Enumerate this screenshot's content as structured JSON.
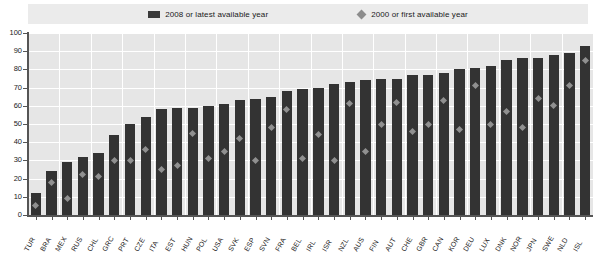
{
  "legend": {
    "position": "top-center",
    "items": [
      {
        "label": "2008 or latest available year",
        "marker": "bar-swatch",
        "color": "#333333"
      },
      {
        "label": "2000 or first available year",
        "marker": "diamond",
        "color": "#909090"
      }
    ]
  },
  "axes": {
    "y": {
      "ticks": [
        "0",
        "10",
        "20",
        "30",
        "40",
        "50",
        "60",
        "70",
        "80",
        "90",
        "100"
      ],
      "min": 0,
      "max": 100,
      "step": 10,
      "label": ""
    },
    "x": {
      "label": ""
    }
  },
  "chart_data": {
    "type": "bar",
    "title": "",
    "subtitle": "",
    "xlabel": "",
    "ylabel": "",
    "ylim": [
      0,
      100
    ],
    "grid": true,
    "categories": [
      "TUR",
      "BRA",
      "MEX",
      "RUS",
      "CHL",
      "GRC",
      "PRT",
      "CZE",
      "ITA",
      "EST",
      "HUN",
      "POL",
      "USA",
      "SVK",
      "ESP",
      "SVN",
      "FRA",
      "BEL",
      "IRL",
      "ISR",
      "NZL",
      "AUS",
      "FIN",
      "AUT",
      "CHE",
      "GBR",
      "CAN",
      "KOR",
      "DEU",
      "LUX",
      "DNK",
      "NOR",
      "JPN",
      "SWE",
      "NLD",
      "ISL"
    ],
    "series": [
      {
        "name": "2008 or latest available year",
        "type": "bar",
        "color": "#333333",
        "values": [
          12,
          24,
          29,
          32,
          34,
          44,
          50,
          54,
          58,
          59,
          59,
          60,
          61,
          63,
          64,
          65,
          68,
          69,
          70,
          72,
          73,
          74,
          75,
          75,
          77,
          77,
          78,
          80,
          81,
          82,
          85,
          86,
          86,
          88,
          89,
          93
        ]
      },
      {
        "name": "2000 or first available year",
        "type": "scatter-diamond",
        "color": "#909090",
        "values": [
          5,
          18,
          9,
          22,
          21,
          30,
          30,
          36,
          25,
          27,
          45,
          31,
          35,
          42,
          30,
          48,
          58,
          31,
          44,
          30,
          61,
          35,
          50,
          62,
          46,
          50,
          63,
          47,
          71,
          50,
          57,
          48,
          64,
          60,
          71,
          85
        ]
      }
    ],
    "legend_position": "top"
  }
}
